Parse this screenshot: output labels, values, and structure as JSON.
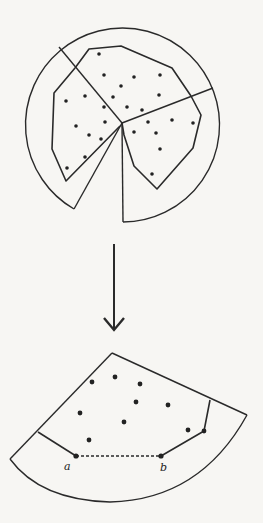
{
  "figure": {
    "top": {
      "description": "circle partitioned into three wedges by rays from center, with point sets and convex hulls",
      "circle": {
        "cx": 122,
        "cy": 123,
        "r": 97
      },
      "center": [
        122,
        123
      ]
    },
    "arrow": {
      "direction": "down"
    },
    "bottom": {
      "description": "single annular wedge with points, partial hull and dashed edge between a and b",
      "labels": {
        "a": "a",
        "b": "b"
      }
    }
  }
}
